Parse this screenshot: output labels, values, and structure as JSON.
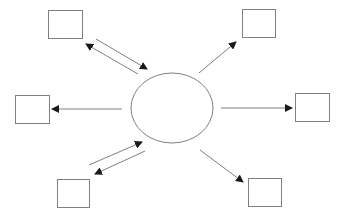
{
  "diagram": {
    "type": "hub-and-spoke",
    "stroke_color": "#808080",
    "arrow_color": "#1a1a1a",
    "hub": {
      "shape": "ellipse",
      "cx": 172,
      "cy": 108,
      "rx": 41,
      "ry": 35
    },
    "nodes": [
      {
        "id": "top-left",
        "x": 48,
        "y": 10,
        "w": 34,
        "h": 28
      },
      {
        "id": "top-right",
        "x": 242,
        "y": 9,
        "w": 33,
        "h": 28
      },
      {
        "id": "left",
        "x": 15,
        "y": 95,
        "w": 34,
        "h": 28
      },
      {
        "id": "right",
        "x": 295,
        "y": 93,
        "w": 34,
        "h": 28
      },
      {
        "id": "bottom-left",
        "x": 57,
        "y": 179,
        "w": 32,
        "h": 28
      },
      {
        "id": "bottom-right",
        "x": 248,
        "y": 178,
        "w": 33,
        "h": 28
      }
    ],
    "edges": [
      {
        "id": "hub-from-top-left",
        "direction": "to-hub",
        "x1": 96,
        "y1": 39,
        "x2": 147,
        "y2": 69
      },
      {
        "id": "hub-to-top-left",
        "direction": "from-hub",
        "x1": 138,
        "y1": 74,
        "x2": 86,
        "y2": 44
      },
      {
        "id": "hub-to-top-right",
        "direction": "from-hub",
        "x1": 199,
        "y1": 73,
        "x2": 236,
        "y2": 42
      },
      {
        "id": "hub-to-left",
        "direction": "from-hub",
        "x1": 122,
        "y1": 109,
        "x2": 52,
        "y2": 109
      },
      {
        "id": "hub-to-right",
        "direction": "from-hub",
        "x1": 221,
        "y1": 108,
        "x2": 292,
        "y2": 108
      },
      {
        "id": "hub-from-bottom-left",
        "direction": "to-hub",
        "x1": 89,
        "y1": 165,
        "x2": 142,
        "y2": 142
      },
      {
        "id": "hub-to-bottom-left",
        "direction": "from-hub",
        "x1": 145,
        "y1": 151,
        "x2": 95,
        "y2": 174
      },
      {
        "id": "hub-to-bottom-right",
        "direction": "from-hub",
        "x1": 200,
        "y1": 150,
        "x2": 243,
        "y2": 182
      }
    ]
  }
}
